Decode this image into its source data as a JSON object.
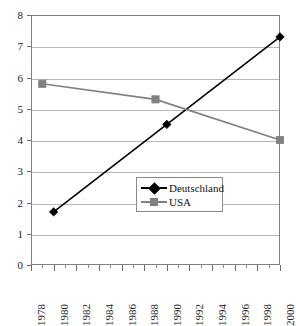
{
  "chart_data": {
    "type": "line",
    "title": "",
    "subtitle": "",
    "xlabel": "",
    "ylabel": "",
    "xlim": [
      1978,
      2000
    ],
    "ylim": [
      0,
      8
    ],
    "grid": true,
    "grid_axis": "y",
    "legend_position": "inside-center-right",
    "y_ticks": [
      0,
      1,
      2,
      3,
      4,
      5,
      6,
      7,
      8
    ],
    "y_tick_labels": [
      "0",
      "1",
      "2",
      "3",
      "4",
      "5",
      "6",
      "7",
      "8"
    ],
    "x_ticks": [
      1978,
      1980,
      1982,
      1984,
      1986,
      1988,
      1990,
      1992,
      1994,
      1996,
      1998,
      2000
    ],
    "x_tick_labels": [
      "1978",
      "1980",
      "1982",
      "1984",
      "1986",
      "1988",
      "1990",
      "1992",
      "1994",
      "1996",
      "1998",
      "2000"
    ],
    "x_minor_ticks": [
      1979,
      1981,
      1983,
      1985,
      1987,
      1989,
      1991,
      1993,
      1995,
      1997,
      1999
    ],
    "series": [
      {
        "name": "Deutschland",
        "color": "#000000",
        "marker": "diamond",
        "x": [
          1980,
          1990,
          2000
        ],
        "values": [
          1.7,
          4.5,
          7.3
        ]
      },
      {
        "name": "USA",
        "color": "#808080",
        "marker": "square",
        "x": [
          1979,
          1989,
          2000
        ],
        "values": [
          5.8,
          5.3,
          4.0
        ]
      }
    ]
  },
  "legend": {
    "entries": [
      {
        "label": "Deutschland"
      },
      {
        "label": "USA"
      }
    ]
  },
  "colors": {
    "deutschland": "#000000",
    "usa": "#808080",
    "gridline": "#b8b8b8",
    "frame": "#808080",
    "legend_border": "#8a8a8a",
    "background": "#ffffff"
  }
}
